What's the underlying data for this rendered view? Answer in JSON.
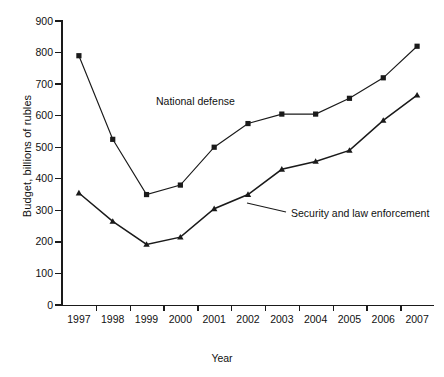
{
  "chart_data": {
    "type": "line",
    "title": "",
    "xlabel": "Year",
    "ylabel": "Budget, billions of rubles",
    "categories": [
      "1997",
      "1998",
      "1999",
      "2000",
      "2001",
      "2002",
      "2003",
      "2004",
      "2005",
      "2006",
      "2007"
    ],
    "x": [
      1997,
      1998,
      1999,
      2000,
      2001,
      2002,
      2003,
      2004,
      2005,
      2006,
      2007
    ],
    "ylim": [
      0,
      900
    ],
    "ytick_step": 100,
    "yticks": [
      "0",
      "100",
      "200",
      "300",
      "400",
      "500",
      "600",
      "700",
      "800",
      "900"
    ],
    "grid": false,
    "legend": "inline-labels",
    "series": [
      {
        "name": "National defense",
        "marker": "square",
        "color": "#1a1a1a",
        "values": [
          790,
          525,
          350,
          380,
          500,
          575,
          605,
          605,
          655,
          720,
          820
        ]
      },
      {
        "name": "Security and law enforcement",
        "marker": "triangle",
        "color": "#1a1a1a",
        "values": [
          355,
          265,
          192,
          215,
          305,
          350,
          430,
          455,
          490,
          585,
          665
        ]
      }
    ]
  },
  "annotations": {
    "defense_label": "National defense",
    "security_label": "Security and law enforcement"
  }
}
